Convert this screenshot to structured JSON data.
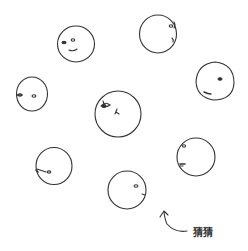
{
  "illustration": {
    "stroke_color": "#333333",
    "background": "#ffffff",
    "faces": [
      {
        "id": "top-left",
        "cx": 76,
        "cy": 44,
        "r": 18,
        "facing": "left"
      },
      {
        "id": "top-right",
        "cx": 158,
        "cy": 34,
        "r": 19,
        "facing": "right"
      },
      {
        "id": "middle-left",
        "cx": 32,
        "cy": 94,
        "r": 16,
        "facing": "left"
      },
      {
        "id": "center",
        "cx": 118,
        "cy": 113,
        "r": 23,
        "facing": "front-left"
      },
      {
        "id": "middle-right",
        "cx": 215,
        "cy": 81,
        "r": 19,
        "facing": "down-left"
      },
      {
        "id": "lower-left",
        "cx": 54,
        "cy": 166,
        "r": 18,
        "facing": "left"
      },
      {
        "id": "lower-right",
        "cx": 196,
        "cy": 157,
        "r": 19,
        "facing": "left"
      },
      {
        "id": "bottom",
        "cx": 127,
        "cy": 190,
        "r": 19,
        "facing": "right"
      }
    ],
    "annotation": {
      "text": "猜猜",
      "arrow": "curved-arrow-pointing-up-left"
    }
  }
}
